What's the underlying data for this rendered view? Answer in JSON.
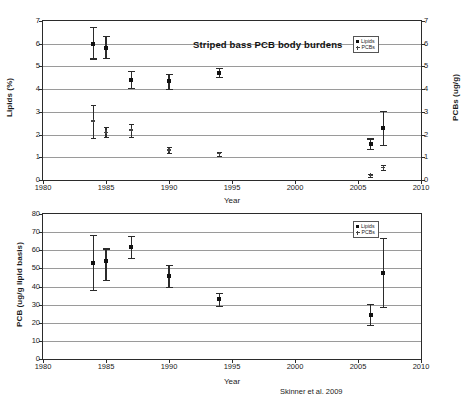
{
  "figure": {
    "credit": "Skinner et al. 2009"
  },
  "chart_data": [
    {
      "type": "scatter",
      "panel": "top",
      "title": "Striped bass PCB body burdens",
      "xlabel": "Year",
      "ylabel": "Lipids (%)",
      "ylabel_right": "PCBs (ug/g)",
      "xlim": [
        1980,
        2010
      ],
      "ylim": [
        0,
        7
      ],
      "ylim_right": [
        0,
        7
      ],
      "xticks": [
        1980,
        1985,
        1990,
        1995,
        2000,
        2005,
        2010
      ],
      "yticks": [
        0,
        1,
        2,
        3,
        4,
        5,
        6,
        7
      ],
      "yticks_right": [
        0,
        1,
        2,
        3,
        4,
        5,
        6,
        7
      ],
      "grid": true,
      "legend_position": "top-right",
      "series": [
        {
          "name": "Lipids",
          "marker": "square",
          "x": [
            1984,
            1985,
            1987,
            1990,
            1994,
            2006,
            2007
          ],
          "values": [
            5.97,
            5.83,
            4.42,
            4.35,
            4.73,
            1.6,
            2.27
          ],
          "err_low": [
            0.62,
            0.47,
            0.37,
            0.35,
            0.2,
            0.22,
            0.72
          ],
          "err_high": [
            0.75,
            0.5,
            0.38,
            0.33,
            0.22,
            0.23,
            0.75
          ]
        },
        {
          "name": "PCBs",
          "marker": "cross",
          "x": [
            1984,
            1985,
            1987,
            1990,
            1994,
            2006,
            2007
          ],
          "values": [
            2.6,
            2.1,
            2.2,
            1.32,
            1.15,
            0.2,
            0.55
          ],
          "err_low": [
            0.75,
            0.2,
            0.3,
            0.12,
            0.1,
            0.07,
            0.12
          ],
          "err_high": [
            0.72,
            0.22,
            0.28,
            0.12,
            0.1,
            0.07,
            0.12
          ]
        }
      ]
    },
    {
      "type": "scatter",
      "panel": "bottom",
      "title": "",
      "xlabel": "Year",
      "ylabel": "PCB (ug/g lipid basis)",
      "xlim": [
        1980,
        2010
      ],
      "ylim": [
        0,
        80
      ],
      "xticks": [
        1980,
        1985,
        1990,
        1995,
        2000,
        2005,
        2010
      ],
      "yticks": [
        0,
        10,
        20,
        30,
        40,
        50,
        60,
        70,
        80
      ],
      "grid": true,
      "legend_position": "top-right",
      "series": [
        {
          "name": "Lipids",
          "marker": "square",
          "x": [
            1984,
            1985,
            1987,
            1990,
            1994,
            2006,
            2007
          ],
          "values": [
            53,
            54,
            62,
            46,
            33,
            24.5,
            47.5
          ],
          "err_low": [
            15,
            10.5,
            6,
            6,
            3.5,
            5.5,
            19
          ],
          "err_high": [
            15.5,
            7,
            6,
            6,
            3.5,
            6,
            19.5
          ]
        },
        {
          "name": "PCBs",
          "marker": "cross",
          "x": [],
          "values": [],
          "err_low": [],
          "err_high": []
        }
      ]
    }
  ]
}
